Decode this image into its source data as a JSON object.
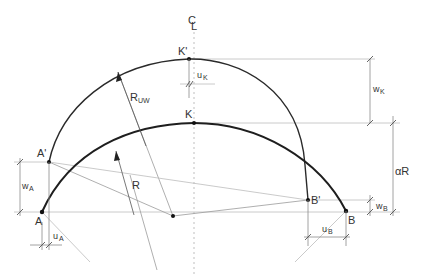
{
  "diagram": {
    "type": "engineering-arch-deformation",
    "centerline_label": "C",
    "centerline_sub": "L",
    "points": {
      "K_prime": "K'",
      "K": "K",
      "A_prime": "A'",
      "A": "A",
      "B_prime": "B'",
      "B": "B"
    },
    "radii": {
      "deformed": {
        "main": "R",
        "sub": "UW"
      },
      "original": {
        "main": "R"
      }
    },
    "dimensions": {
      "u_K": {
        "main": "u",
        "sub": "K"
      },
      "w_K": {
        "main": "w",
        "sub": "K"
      },
      "w_A": {
        "main": "w",
        "sub": "A"
      },
      "u_A": {
        "main": "u",
        "sub": "A"
      },
      "w_B": {
        "main": "w",
        "sub": "B"
      },
      "u_B": {
        "main": "u",
        "sub": "B"
      },
      "alpha_R": "αR"
    },
    "colors": {
      "line": "#1e1e1e",
      "construction": "#9a9a9a",
      "background": "#ffffff"
    }
  }
}
